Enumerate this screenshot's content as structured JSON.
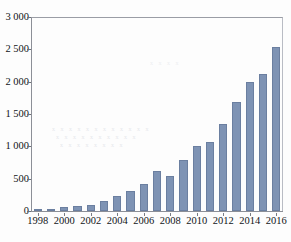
{
  "chart_data": {
    "type": "bar",
    "title": "",
    "subtitle": "",
    "xlabel": "",
    "ylabel": "",
    "categories": [
      "1998",
      "1999",
      "2000",
      "2001",
      "2002",
      "2003",
      "2004",
      "2005",
      "2006",
      "2007",
      "2008",
      "2009",
      "2010",
      "2011",
      "2012",
      "2013",
      "2014",
      "2015",
      "2016"
    ],
    "values": [
      15,
      30,
      62,
      78,
      100,
      155,
      235,
      305,
      425,
      615,
      535,
      785,
      1000,
      1060,
      1350,
      1690,
      1990,
      2120,
      2540
    ],
    "series": [
      {
        "name": "",
        "values": [
          15,
          30,
          62,
          78,
          100,
          155,
          235,
          305,
          425,
          615,
          535,
          785,
          1000,
          1060,
          1350,
          1690,
          1990,
          2120,
          2540
        ]
      }
    ],
    "ylim": [
      0,
      3000
    ],
    "ytick_values": [
      0,
      500,
      1000,
      1500,
      2000,
      2500,
      3000
    ],
    "ytick_labels": [
      "0",
      "500",
      "1 000",
      "1 500",
      "2 000",
      "2 500",
      "3 000"
    ],
    "xtick_labels": [
      "1998",
      "2000",
      "2002",
      "2004",
      "2006",
      "2008",
      "2010",
      "2012",
      "2014",
      "2016"
    ],
    "xtick_categories": [
      "1998",
      "2000",
      "2002",
      "2004",
      "2006",
      "2008",
      "2010",
      "2012",
      "2014",
      "2016"
    ],
    "grid": false,
    "legend": null,
    "legend_position": "none",
    "annotations": [],
    "bar_color": "#7e93b4",
    "bar_edge_color": "#6b7fa0",
    "axis_color": "#8c8f97",
    "text_color": "#111418",
    "background_color": "#ffffff"
  },
  "artifacts": {
    "show_through_1": "x x x x x x x x x x x x",
    "show_through_2": "x x x x x x x x x x",
    "show_through_3": "x x x x x x x x",
    "show_through_4": "x x x x",
    "caption_partial": ""
  }
}
